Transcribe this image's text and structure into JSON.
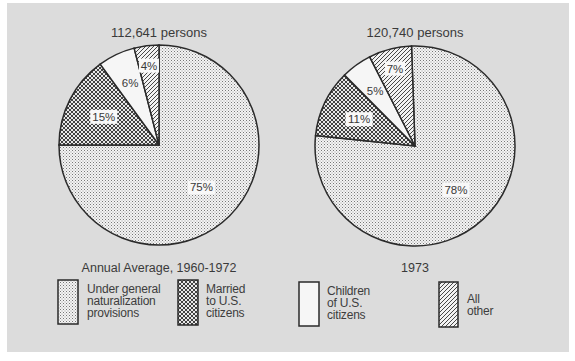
{
  "chart_data": [
    {
      "type": "pie",
      "title": "112,641 persons",
      "caption": "Annual Average, 1960-1972",
      "start_angle_deg": 0,
      "direction": "clockwise",
      "slices": [
        {
          "label": "Under general naturalization provisions",
          "value": 75,
          "value_label": "75%",
          "pattern": "dots"
        },
        {
          "label": "Married to U.S. citizens",
          "value": 15,
          "value_label": "15%",
          "pattern": "crosshatch"
        },
        {
          "label": "Children of U.S. citizens",
          "value": 6,
          "value_label": "6%",
          "pattern": "blank"
        },
        {
          "label": "All other",
          "value": 4,
          "value_label": "4%",
          "pattern": "diagonal"
        }
      ]
    },
    {
      "type": "pie",
      "title": "120,740 persons",
      "caption": "1973",
      "start_angle_deg": -2,
      "direction": "clockwise",
      "slices": [
        {
          "label": "Under general naturalization provisions",
          "value": 78,
          "value_label": "78%",
          "pattern": "dots"
        },
        {
          "label": "Married to U.S. citizens",
          "value": 11,
          "value_label": "11%",
          "pattern": "crosshatch"
        },
        {
          "label": "Children of U.S. citizens",
          "value": 5,
          "value_label": "5%",
          "pattern": "blank"
        },
        {
          "label": "All other",
          "value": 7,
          "value_label": "7%",
          "pattern": "diagonal"
        }
      ]
    }
  ],
  "legend": [
    {
      "label": "Under general\nnaturalization\nprovisions",
      "pattern": "dots"
    },
    {
      "label": "Married\nto U.S.\ncitizens",
      "pattern": "crosshatch"
    },
    {
      "label": "Children\nof U.S.\ncitizens",
      "pattern": "blank"
    },
    {
      "label": "All\nother",
      "pattern": "diagonal"
    }
  ],
  "colors": {
    "panel_background": "#dcdcdc",
    "line": "#2a2a2a",
    "slice_fill": "#f2f2f2",
    "text": "#3a3a3a"
  }
}
